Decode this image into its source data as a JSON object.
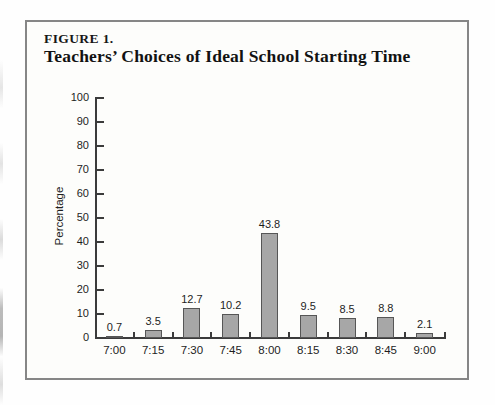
{
  "figure": {
    "label": "FIGURE 1.",
    "title": "Teachers’ Choices of Ideal School Starting Time"
  },
  "chart_data": {
    "type": "bar",
    "title": "Teachers’ Choices of Ideal School Starting Time",
    "categories": [
      "7:00",
      "7:15",
      "7:30",
      "7:45",
      "8:00",
      "8:15",
      "8:30",
      "8:45",
      "9:00"
    ],
    "values": [
      0.7,
      3.5,
      12.7,
      10.2,
      43.8,
      9.5,
      8.5,
      8.8,
      2.1
    ],
    "value_labels": [
      "0.7",
      "3.5",
      "12.7",
      "10.2",
      "43.8",
      "9.5",
      "8.5",
      "8.8",
      "2.1"
    ],
    "xlabel": "",
    "ylabel": "Percentage",
    "ylim": [
      0,
      100
    ],
    "y_ticks": [
      0,
      10,
      20,
      30,
      40,
      50,
      60,
      70,
      80,
      90,
      100
    ],
    "grid": false,
    "legend": false,
    "bar_color": "#a7a7a7",
    "bar_border_color": "#565656",
    "axis_color": "#3b3b3b"
  }
}
